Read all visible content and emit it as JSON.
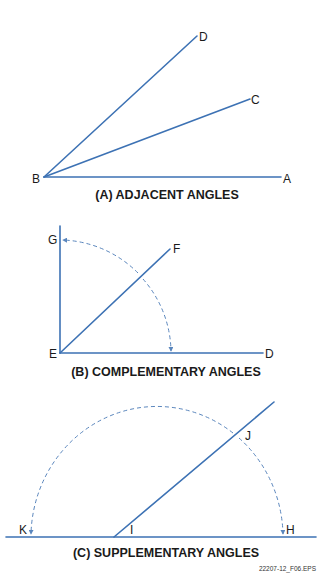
{
  "colors": {
    "line": "#3d72b4",
    "arc": "#5a86bd",
    "text": "#1a1a1a",
    "background": "#ffffff"
  },
  "panels": [
    {
      "id": "A",
      "caption": "(A) ADJACENT ANGLES",
      "labels": {
        "B": "B",
        "A": "A",
        "C": "C",
        "D": "D"
      }
    },
    {
      "id": "B",
      "caption": "(B) COMPLEMENTARY ANGLES",
      "labels": {
        "E": "E",
        "D": "D",
        "F": "F",
        "G": "G"
      }
    },
    {
      "id": "C",
      "caption": "(C) SUPPLEMENTARY ANGLES",
      "labels": {
        "K": "K",
        "I": "I",
        "H": "H",
        "J": "J"
      }
    }
  ],
  "file_label": "22207-12_F06.EPS"
}
